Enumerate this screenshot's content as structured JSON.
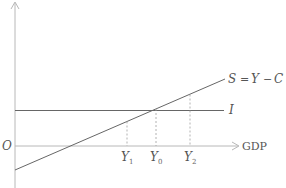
{
  "diagram": {
    "title": "",
    "origin_label": "O",
    "x_axis_label": "GDP",
    "curves": {
      "saving": {
        "label": "S = Y − C",
        "label_parts": {
          "s": "S",
          "eq": "=",
          "y": "Y",
          "minus": "−",
          "c": "C"
        }
      },
      "investment": {
        "label": "I"
      }
    },
    "ticks": [
      {
        "base": "Y",
        "sub": "1"
      },
      {
        "base": "Y",
        "sub": "0"
      },
      {
        "base": "Y",
        "sub": "2"
      }
    ],
    "colors": {
      "axis": "#b0b0b0",
      "line": "#555555",
      "dash": "#9a9a9a",
      "text": "#555555"
    }
  }
}
